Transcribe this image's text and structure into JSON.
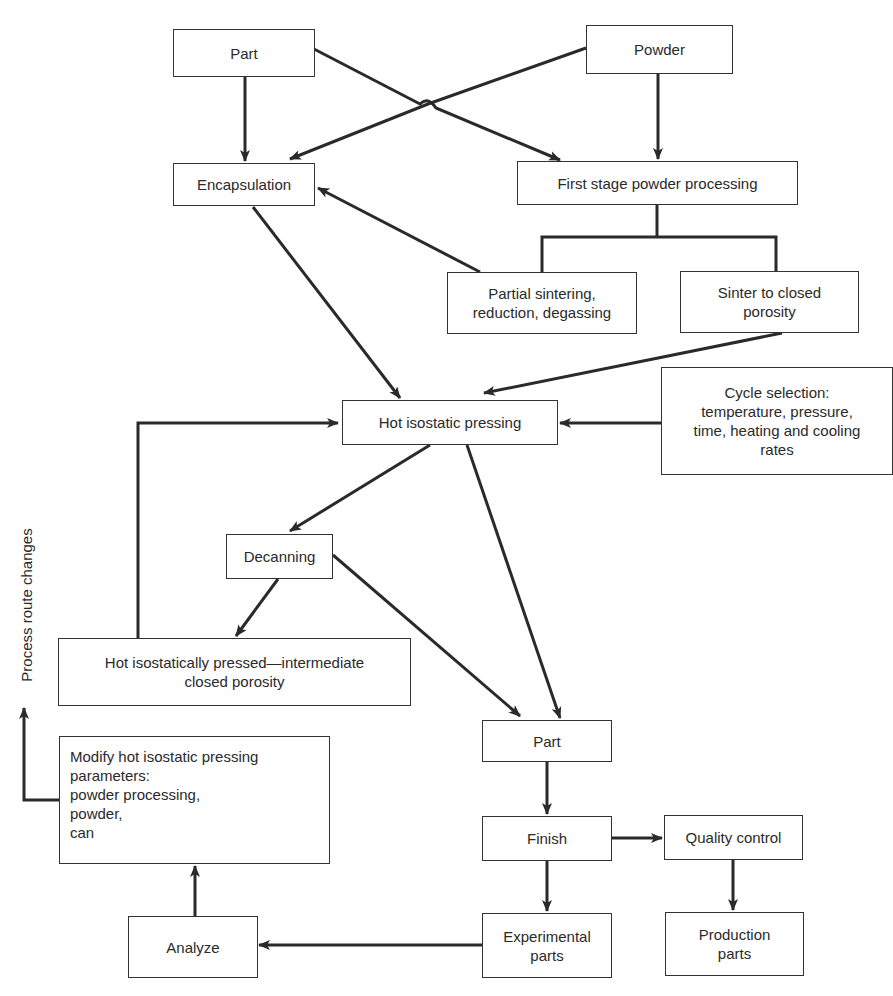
{
  "diagram": {
    "nodes": {
      "part_top": "Part",
      "powder": "Powder",
      "encapsulation": "Encapsulation",
      "first_stage": "First stage powder processing",
      "partial_sintering": "Partial sintering,\nreduction, degassing",
      "sinter_closed": "Sinter to closed\nporosity",
      "hip": "Hot isostatic pressing",
      "cycle_selection": "Cycle selection:\ntemperature, pressure,\ntime, heating and cooling\nrates",
      "decanning": "Decanning",
      "hip_intermediate": "Hot isostatically pressed—intermediate\nclosed porosity",
      "part_bottom": "Part",
      "modify": "Modify hot isostatic pressing\nparameters:\npowder processing,\npowder,\ncan",
      "finish": "Finish",
      "quality_control": "Quality control",
      "analyze": "Analyze",
      "experimental_parts": "Experimental\nparts",
      "production_parts": "Production\nparts"
    },
    "side_label": "Process route changes",
    "edges": [
      {
        "from": "Part",
        "to": "Encapsulation"
      },
      {
        "from": "Part",
        "to": "First stage powder processing"
      },
      {
        "from": "Powder",
        "to": "Encapsulation"
      },
      {
        "from": "Powder",
        "to": "First stage powder processing"
      },
      {
        "from": "First stage powder processing",
        "to": "Partial sintering, reduction, degassing"
      },
      {
        "from": "First stage powder processing",
        "to": "Sinter to closed porosity"
      },
      {
        "from": "Partial sintering, reduction, degassing",
        "to": "Encapsulation"
      },
      {
        "from": "Encapsulation",
        "to": "Hot isostatic pressing"
      },
      {
        "from": "Sinter to closed porosity",
        "to": "Hot isostatic pressing"
      },
      {
        "from": "Cycle selection",
        "to": "Hot isostatic pressing"
      },
      {
        "from": "Hot isostatic pressing",
        "to": "Decanning"
      },
      {
        "from": "Hot isostatic pressing",
        "to": "Part"
      },
      {
        "from": "Decanning",
        "to": "Hot isostatically pressed—intermediate closed porosity"
      },
      {
        "from": "Decanning",
        "to": "Part"
      },
      {
        "from": "Hot isostatically pressed—intermediate closed porosity",
        "to": "Hot isostatic pressing"
      },
      {
        "from": "Part",
        "to": "Finish"
      },
      {
        "from": "Finish",
        "to": "Quality control"
      },
      {
        "from": "Finish",
        "to": "Experimental parts"
      },
      {
        "from": "Quality control",
        "to": "Production parts"
      },
      {
        "from": "Experimental parts",
        "to": "Analyze"
      },
      {
        "from": "Analyze",
        "to": "Modify hot isostatic pressing parameters"
      },
      {
        "from": "Modify hot isostatic pressing parameters",
        "to": "Process route changes"
      }
    ]
  }
}
